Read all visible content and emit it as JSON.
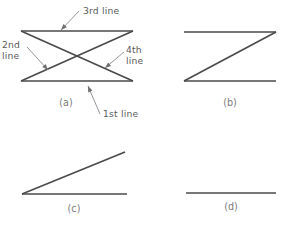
{
  "figure": {
    "panels": [
      {
        "id": "a",
        "caption": "(a)",
        "caption_x": 66,
        "caption_y": 106,
        "shape": "bowtie",
        "lines": [
          {
            "name": "1st line",
            "x1": 21,
            "y1": 81,
            "x2": 133,
            "y2": 81
          },
          {
            "name": "2nd line",
            "x1": 21,
            "y1": 31,
            "x2": 133,
            "y2": 81
          },
          {
            "name": "3rd line",
            "x1": 21,
            "y1": 31,
            "x2": 133,
            "y2": 31
          },
          {
            "name": "4th line",
            "x1": 21,
            "y1": 81,
            "x2": 133,
            "y2": 31
          }
        ]
      },
      {
        "id": "b",
        "caption": "(b)",
        "caption_x": 230,
        "caption_y": 106,
        "shape": "z-shape",
        "lines": [
          {
            "name": "top line",
            "x1": 184,
            "y1": 32,
            "x2": 276,
            "y2": 32
          },
          {
            "name": "diagonal line",
            "x1": 276,
            "y1": 32,
            "x2": 184,
            "y2": 81
          },
          {
            "name": "bottom line",
            "x1": 184,
            "y1": 81,
            "x2": 276,
            "y2": 81
          }
        ]
      },
      {
        "id": "c",
        "caption": "(c)",
        "caption_x": 74,
        "caption_y": 212,
        "shape": "wedge",
        "lines": [
          {
            "name": "base line",
            "x1": 22,
            "y1": 194,
            "x2": 127,
            "y2": 194
          },
          {
            "name": "diagonal line",
            "x1": 22,
            "y1": 194,
            "x2": 125,
            "y2": 152
          }
        ]
      },
      {
        "id": "d",
        "caption": "(d)",
        "caption_x": 231,
        "caption_y": 210,
        "shape": "single-line",
        "lines": [
          {
            "name": "single line",
            "x1": 186,
            "y1": 193,
            "x2": 276,
            "y2": 193
          }
        ]
      }
    ],
    "annotations": [
      {
        "id": "third-line",
        "text": "3rd  line",
        "text_x": 83,
        "text_y": 14,
        "text_anchor": "start",
        "multiline": false,
        "leader": {
          "x1": 79,
          "y1": 11,
          "x2": 61,
          "y2": 30
        },
        "arrow": {
          "x": 61,
          "y": 30,
          "angle": 134
        }
      },
      {
        "id": "second-line",
        "text_lines": [
          "2nd",
          "line"
        ],
        "text_x": 2,
        "text_y": 48,
        "text_anchor": "start",
        "multiline": true,
        "line_height": 11,
        "leader": {
          "x1": 27,
          "y1": 47,
          "x2": 48,
          "y2": 70
        },
        "arrow": {
          "x": 48,
          "y": 70,
          "angle": 48
        }
      },
      {
        "id": "fourth-line",
        "text_lines": [
          "4th",
          "line"
        ],
        "text_x": 126,
        "text_y": 53,
        "text_anchor": "start",
        "multiline": true,
        "line_height": 11,
        "leader": {
          "x1": 124,
          "y1": 52,
          "x2": 105,
          "y2": 68
        },
        "arrow": {
          "x": 105,
          "y": 68,
          "angle": 140
        }
      },
      {
        "id": "first-line",
        "text": "1st  line",
        "text_x": 103,
        "text_y": 117,
        "text_anchor": "start",
        "multiline": false,
        "leader": {
          "x1": 100,
          "y1": 114,
          "x2": 88,
          "y2": 86
        },
        "arrow": {
          "x": 88,
          "y": 86,
          "angle": -113
        }
      }
    ]
  }
}
